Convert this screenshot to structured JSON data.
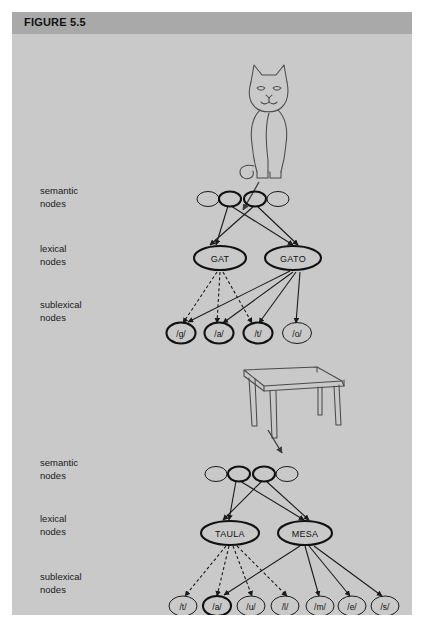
{
  "figure": {
    "title": "FIGURE 5.5",
    "background_color": "#c9c9c9",
    "header_color": "#a9a9a9"
  },
  "row_labels": {
    "semantic_line1": "semantic",
    "semantic_line2": "nodes",
    "lexical_line1": "lexical",
    "lexical_line2": "nodes",
    "sublexical_line1": "sublexical",
    "sublexical_line2": "nodes"
  },
  "top_diagram": {
    "picture": "cat-drawing",
    "semantic_nodes": [
      {
        "label": "",
        "emphasis": "thin"
      },
      {
        "label": "",
        "emphasis": "bold"
      },
      {
        "label": "",
        "emphasis": "bold"
      },
      {
        "label": "",
        "emphasis": "thin"
      }
    ],
    "lexical_nodes": [
      {
        "label": "GAT",
        "emphasis": "bold"
      },
      {
        "label": "GATO",
        "emphasis": "bold"
      }
    ],
    "sublexical_nodes": [
      {
        "label": "/g/",
        "emphasis": "bold"
      },
      {
        "label": "/a/",
        "emphasis": "bold"
      },
      {
        "label": "/t/",
        "emphasis": "bold"
      },
      {
        "label": "/o/",
        "emphasis": "thin"
      }
    ],
    "links_semantic_to_lexical": [
      {
        "from": 1,
        "to": "GAT",
        "style": "solid"
      },
      {
        "from": 1,
        "to": "GATO",
        "style": "solid"
      },
      {
        "from": 2,
        "to": "GAT",
        "style": "solid"
      },
      {
        "from": 2,
        "to": "GATO",
        "style": "solid"
      }
    ],
    "links_lexical_to_sublexical": [
      {
        "from": "GAT",
        "to": "/g/",
        "style": "dashed"
      },
      {
        "from": "GAT",
        "to": "/a/",
        "style": "dashed"
      },
      {
        "from": "GAT",
        "to": "/t/",
        "style": "dashed"
      },
      {
        "from": "GATO",
        "to": "/g/",
        "style": "solid"
      },
      {
        "from": "GATO",
        "to": "/a/",
        "style": "solid"
      },
      {
        "from": "GATO",
        "to": "/t/",
        "style": "solid"
      },
      {
        "from": "GATO",
        "to": "/o/",
        "style": "solid"
      }
    ]
  },
  "bottom_diagram": {
    "picture": "table-drawing",
    "semantic_nodes": [
      {
        "label": "",
        "emphasis": "thin"
      },
      {
        "label": "",
        "emphasis": "bold"
      },
      {
        "label": "",
        "emphasis": "bold"
      },
      {
        "label": "",
        "emphasis": "thin"
      }
    ],
    "lexical_nodes": [
      {
        "label": "TAULA",
        "emphasis": "bold"
      },
      {
        "label": "MESA",
        "emphasis": "bold"
      }
    ],
    "sublexical_nodes": [
      {
        "label": "/t/",
        "emphasis": "thin"
      },
      {
        "label": "/a/",
        "emphasis": "bold"
      },
      {
        "label": "/u/",
        "emphasis": "thin"
      },
      {
        "label": "/l/",
        "emphasis": "thin"
      },
      {
        "label": "/m/",
        "emphasis": "thin"
      },
      {
        "label": "/e/",
        "emphasis": "thin"
      },
      {
        "label": "/s/",
        "emphasis": "thin"
      }
    ],
    "links_semantic_to_lexical": [
      {
        "from": 1,
        "to": "TAULA",
        "style": "solid"
      },
      {
        "from": 1,
        "to": "MESA",
        "style": "solid"
      },
      {
        "from": 2,
        "to": "TAULA",
        "style": "solid"
      },
      {
        "from": 2,
        "to": "MESA",
        "style": "solid"
      }
    ],
    "links_lexical_to_sublexical": [
      {
        "from": "TAULA",
        "to": "/t/",
        "style": "dashed"
      },
      {
        "from": "TAULA",
        "to": "/a/",
        "style": "dashed"
      },
      {
        "from": "TAULA",
        "to": "/u/",
        "style": "dashed"
      },
      {
        "from": "TAULA",
        "to": "/l/",
        "style": "dashed"
      },
      {
        "from": "MESA",
        "to": "/a/",
        "style": "solid"
      },
      {
        "from": "MESA",
        "to": "/m/",
        "style": "solid"
      },
      {
        "from": "MESA",
        "to": "/e/",
        "style": "solid"
      },
      {
        "from": "MESA",
        "to": "/s/",
        "style": "solid"
      }
    ]
  }
}
